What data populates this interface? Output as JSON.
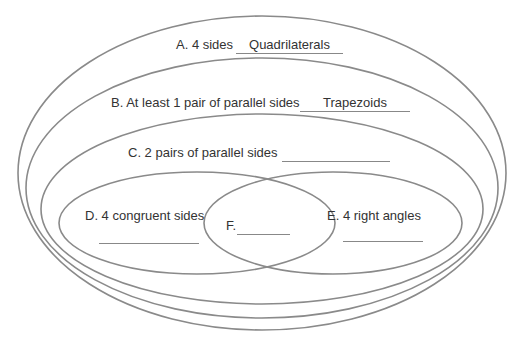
{
  "diagram": {
    "type": "nested-venn",
    "line_color": "#8a8a8a",
    "regions": [
      {
        "id": "A",
        "label": "A. 4 sides",
        "answer": "Quadrilaterals"
      },
      {
        "id": "B",
        "label": "B. At least 1 pair of parallel sides",
        "answer": "Trapezoids"
      },
      {
        "id": "C",
        "label": "C. 2 pairs of parallel sides",
        "answer": ""
      },
      {
        "id": "D",
        "label": "D. 4 congruent sides",
        "answer": ""
      },
      {
        "id": "E",
        "label": "E. 4 right angles",
        "answer": ""
      },
      {
        "id": "F",
        "label": "F.",
        "answer": ""
      }
    ]
  }
}
